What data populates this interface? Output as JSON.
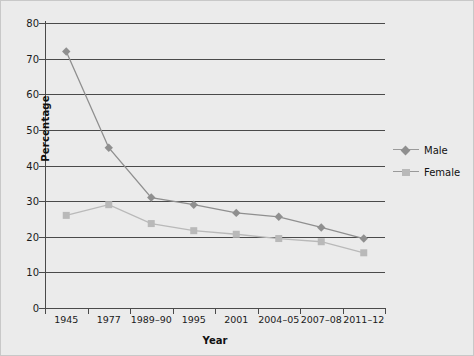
{
  "chart_data": {
    "type": "line",
    "title": "",
    "xlabel": "Year",
    "ylabel": "Percentage",
    "ylim": [
      0,
      80
    ],
    "yticks": [
      0,
      10,
      20,
      30,
      40,
      50,
      60,
      70,
      80
    ],
    "grid": true,
    "legend_position": "right",
    "categories": [
      "1945",
      "1977",
      "1989–90",
      "1995",
      "2001",
      "2004–05",
      "2007–08",
      "2011–12"
    ],
    "series": [
      {
        "name": "Male",
        "marker": "diamond",
        "color": "#8f8f8f",
        "values": [
          72,
          45,
          31,
          29,
          26.7,
          25.6,
          22.6,
          19.5
        ]
      },
      {
        "name": "Female",
        "marker": "square",
        "color": "#b9b9b9",
        "values": [
          26,
          29,
          23.7,
          21.7,
          20.7,
          19.5,
          18.6,
          15.5
        ]
      }
    ]
  },
  "legend": {
    "items": [
      {
        "label": "Male"
      },
      {
        "label": "Female"
      }
    ]
  },
  "colors": {
    "background": "#ebebeb",
    "axis": "#4a4a4a",
    "male": "#8f8f8f",
    "female": "#b9b9b9",
    "text": "#111111"
  }
}
